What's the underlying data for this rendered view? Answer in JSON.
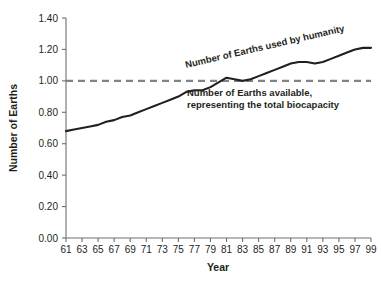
{
  "chart_data": {
    "type": "line",
    "title": "",
    "xlabel": "Year",
    "ylabel": "Number of Earths",
    "xlim": [
      61,
      99
    ],
    "ylim": [
      0.0,
      1.4
    ],
    "grid": false,
    "legend": "none",
    "xticks": [
      "61",
      "63",
      "65",
      "67",
      "69",
      "71",
      "73",
      "75",
      "77",
      "79",
      "81",
      "83",
      "85",
      "87",
      "89",
      "91",
      "93",
      "95",
      "97",
      "99"
    ],
    "yticks": [
      "0.00",
      "0.20",
      "0.40",
      "0.60",
      "0.80",
      "1.00",
      "1.20",
      "1.40"
    ],
    "series": [
      {
        "name": "Number of Earths used by humanity",
        "style": "solid",
        "color": "#231f20",
        "x": [
          61,
          62,
          63,
          64,
          65,
          66,
          67,
          68,
          69,
          70,
          71,
          72,
          73,
          74,
          75,
          76,
          77,
          78,
          79,
          80,
          81,
          82,
          83,
          84,
          85,
          86,
          87,
          88,
          89,
          90,
          91,
          92,
          93,
          94,
          95,
          96,
          97,
          98,
          99
        ],
        "values": [
          0.68,
          0.69,
          0.7,
          0.71,
          0.72,
          0.74,
          0.75,
          0.77,
          0.78,
          0.8,
          0.82,
          0.84,
          0.86,
          0.88,
          0.9,
          0.93,
          0.94,
          0.94,
          0.96,
          0.99,
          1.02,
          1.01,
          1.0,
          1.01,
          1.03,
          1.05,
          1.07,
          1.09,
          1.11,
          1.12,
          1.12,
          1.11,
          1.12,
          1.14,
          1.16,
          1.18,
          1.2,
          1.21,
          1.21
        ]
      },
      {
        "name": "Number of Earths available, representing the total biocapacity",
        "style": "dashed",
        "color": "#808285",
        "x": [
          61,
          99
        ],
        "values": [
          1.0,
          1.0
        ]
      }
    ],
    "annotations": [
      {
        "id": "used-by-humanity",
        "text": "Number of Earths used by humanity",
        "rotation": -13,
        "x": 186,
        "y": 68
      },
      {
        "id": "available-biocapacity-line1",
        "text": "Number of Earths available,",
        "rotation": 0,
        "x": 187,
        "y": 96
      },
      {
        "id": "available-biocapacity-line2",
        "text": "representing the total biocapacity",
        "rotation": 0,
        "x": 187,
        "y": 108
      }
    ]
  },
  "colors": {
    "series_line": "#231f20",
    "reference_line": "#808285",
    "axis": "#6d6e71",
    "text": "#231f20",
    "background": "#ffffff"
  }
}
